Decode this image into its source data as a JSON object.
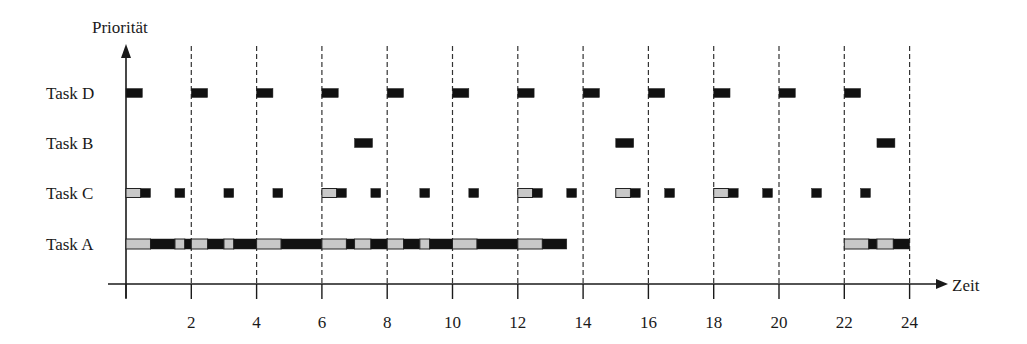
{
  "diagram": {
    "y_axis_label": "Priorität",
    "x_axis_label": "Zeit",
    "tasks": [
      {
        "name": "Task D",
        "label": "Task D"
      },
      {
        "name": "Task B",
        "label": "Task B"
      },
      {
        "name": "Task C",
        "label": "Task C"
      },
      {
        "name": "Task A",
        "label": "Task A"
      }
    ],
    "x_ticks": [
      "2",
      "4",
      "6",
      "8",
      "10",
      "12",
      "14",
      "16",
      "18",
      "20",
      "22",
      "24"
    ],
    "colors": {
      "running": "#111111",
      "ready": "#c8c8c8",
      "axis": "#1a1a1a",
      "grid": "#333333"
    }
  },
  "chart_data": {
    "type": "gantt",
    "title": "",
    "xlabel": "Zeit",
    "ylabel": "Priorität",
    "xlim": [
      0,
      24
    ],
    "x_ticks": [
      2,
      4,
      6,
      8,
      10,
      12,
      14,
      16,
      18,
      20,
      22,
      24
    ],
    "grid": "dashed vertical lines every 2 time units",
    "legend": "black = running (executing), gray = ready (preempted/waiting)",
    "rows": [
      {
        "task": "Task D",
        "segments": [
          {
            "start": 0,
            "end": 0.5,
            "state": "running"
          },
          {
            "start": 2,
            "end": 2.5,
            "state": "running"
          },
          {
            "start": 4,
            "end": 4.5,
            "state": "running"
          },
          {
            "start": 6,
            "end": 6.5,
            "state": "running"
          },
          {
            "start": 8,
            "end": 8.5,
            "state": "running"
          },
          {
            "start": 10,
            "end": 10.5,
            "state": "running"
          },
          {
            "start": 12,
            "end": 12.5,
            "state": "running"
          },
          {
            "start": 14,
            "end": 14.5,
            "state": "running"
          },
          {
            "start": 16,
            "end": 16.5,
            "state": "running"
          },
          {
            "start": 18,
            "end": 18.5,
            "state": "running"
          },
          {
            "start": 20,
            "end": 20.5,
            "state": "running"
          },
          {
            "start": 22,
            "end": 22.5,
            "state": "running"
          }
        ]
      },
      {
        "task": "Task B",
        "segments": [
          {
            "start": 7.0,
            "end": 7.55,
            "state": "running"
          },
          {
            "start": 15.0,
            "end": 15.55,
            "state": "running"
          },
          {
            "start": 23.0,
            "end": 23.55,
            "state": "running"
          }
        ]
      },
      {
        "task": "Task C",
        "segments": [
          {
            "start": 0,
            "end": 0.45,
            "state": "ready"
          },
          {
            "start": 0.45,
            "end": 0.75,
            "state": "running"
          },
          {
            "start": 1.5,
            "end": 1.8,
            "state": "running"
          },
          {
            "start": 3.0,
            "end": 3.3,
            "state": "running"
          },
          {
            "start": 4.5,
            "end": 4.8,
            "state": "running"
          },
          {
            "start": 6,
            "end": 6.45,
            "state": "ready"
          },
          {
            "start": 6.45,
            "end": 6.75,
            "state": "running"
          },
          {
            "start": 7.5,
            "end": 7.8,
            "state": "running"
          },
          {
            "start": 9.0,
            "end": 9.3,
            "state": "running"
          },
          {
            "start": 10.5,
            "end": 10.8,
            "state": "running"
          },
          {
            "start": 12,
            "end": 12.45,
            "state": "ready"
          },
          {
            "start": 12.45,
            "end": 12.75,
            "state": "running"
          },
          {
            "start": 13.5,
            "end": 13.8,
            "state": "running"
          },
          {
            "start": 15,
            "end": 15.45,
            "state": "ready"
          },
          {
            "start": 15.45,
            "end": 15.75,
            "state": "running"
          },
          {
            "start": 16.5,
            "end": 16.8,
            "state": "running"
          },
          {
            "start": 18,
            "end": 18.45,
            "state": "ready"
          },
          {
            "start": 18.45,
            "end": 18.75,
            "state": "running"
          },
          {
            "start": 19.5,
            "end": 19.8,
            "state": "running"
          },
          {
            "start": 21.0,
            "end": 21.3,
            "state": "running"
          },
          {
            "start": 22.5,
            "end": 22.8,
            "state": "running"
          }
        ]
      },
      {
        "task": "Task A",
        "segments": [
          {
            "start": 0,
            "end": 0.75,
            "state": "ready"
          },
          {
            "start": 0.75,
            "end": 1.5,
            "state": "running"
          },
          {
            "start": 1.5,
            "end": 1.8,
            "state": "ready"
          },
          {
            "start": 1.8,
            "end": 2.0,
            "state": "running"
          },
          {
            "start": 2.0,
            "end": 2.5,
            "state": "ready"
          },
          {
            "start": 2.5,
            "end": 3.0,
            "state": "running"
          },
          {
            "start": 3.0,
            "end": 3.3,
            "state": "ready"
          },
          {
            "start": 3.3,
            "end": 4.0,
            "state": "running"
          },
          {
            "start": 4.0,
            "end": 4.75,
            "state": "ready"
          },
          {
            "start": 4.75,
            "end": 6.0,
            "state": "running"
          },
          {
            "start": 6.0,
            "end": 6.75,
            "state": "ready"
          },
          {
            "start": 6.75,
            "end": 7.0,
            "state": "running"
          },
          {
            "start": 7.0,
            "end": 7.5,
            "state": "ready"
          },
          {
            "start": 7.5,
            "end": 8.0,
            "state": "running"
          },
          {
            "start": 8.0,
            "end": 8.5,
            "state": "ready"
          },
          {
            "start": 8.5,
            "end": 9.0,
            "state": "running"
          },
          {
            "start": 9.0,
            "end": 9.3,
            "state": "ready"
          },
          {
            "start": 9.3,
            "end": 10.0,
            "state": "running"
          },
          {
            "start": 10.0,
            "end": 10.75,
            "state": "ready"
          },
          {
            "start": 10.75,
            "end": 12.0,
            "state": "running"
          },
          {
            "start": 12.0,
            "end": 12.75,
            "state": "ready"
          },
          {
            "start": 12.75,
            "end": 13.5,
            "state": "running"
          },
          {
            "start": 22.0,
            "end": 22.75,
            "state": "ready"
          },
          {
            "start": 22.75,
            "end": 23.0,
            "state": "running"
          },
          {
            "start": 23.0,
            "end": 23.5,
            "state": "ready"
          },
          {
            "start": 23.5,
            "end": 24.0,
            "state": "running"
          }
        ]
      }
    ]
  }
}
